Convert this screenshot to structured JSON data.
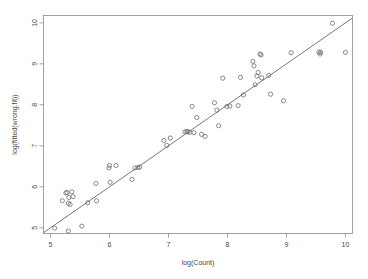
{
  "chart_data": {
    "type": "scatter",
    "title": "",
    "xlabel": "log(Count)",
    "ylabel": "log(fitted(wrong.fit))",
    "xlim": [
      4.88,
      10.12
    ],
    "ylim": [
      4.86,
      10.18
    ],
    "grid": false,
    "legend": null,
    "xticks": [
      5,
      6,
      7,
      8,
      9,
      10
    ],
    "yticks": [
      5,
      6,
      7,
      8,
      9,
      10
    ],
    "xtick_labels": [
      "5",
      "6",
      "7",
      "8",
      "9",
      "10"
    ],
    "ytick_labels": [
      "5",
      "6",
      "7",
      "8",
      "9",
      "10"
    ],
    "reference_line": {
      "type": "identity",
      "x": [
        4.88,
        10.12
      ],
      "y": [
        4.88,
        10.12
      ]
    },
    "point_marker": "open-circle",
    "points": [
      {
        "x": 5.07,
        "y": 4.99
      },
      {
        "x": 5.3,
        "y": 4.92
      },
      {
        "x": 5.53,
        "y": 5.04
      },
      {
        "x": 5.2,
        "y": 5.66
      },
      {
        "x": 5.26,
        "y": 5.85
      },
      {
        "x": 5.28,
        "y": 5.86
      },
      {
        "x": 5.31,
        "y": 5.74
      },
      {
        "x": 5.33,
        "y": 5.57
      },
      {
        "x": 5.36,
        "y": 5.88
      },
      {
        "x": 5.38,
        "y": 5.76
      },
      {
        "x": 5.3,
        "y": 5.6
      },
      {
        "x": 5.63,
        "y": 5.61
      },
      {
        "x": 5.78,
        "y": 5.66
      },
      {
        "x": 5.77,
        "y": 6.08
      },
      {
        "x": 6.01,
        "y": 6.11
      },
      {
        "x": 5.99,
        "y": 6.46
      },
      {
        "x": 6.0,
        "y": 6.52
      },
      {
        "x": 6.11,
        "y": 6.52
      },
      {
        "x": 6.38,
        "y": 6.18
      },
      {
        "x": 6.43,
        "y": 6.46
      },
      {
        "x": 6.48,
        "y": 6.47
      },
      {
        "x": 6.51,
        "y": 6.48
      },
      {
        "x": 6.92,
        "y": 7.13
      },
      {
        "x": 6.97,
        "y": 7.01
      },
      {
        "x": 7.03,
        "y": 7.19
      },
      {
        "x": 7.28,
        "y": 7.34
      },
      {
        "x": 7.31,
        "y": 7.35
      },
      {
        "x": 7.33,
        "y": 7.34
      },
      {
        "x": 7.36,
        "y": 7.33
      },
      {
        "x": 7.4,
        "y": 7.96
      },
      {
        "x": 7.43,
        "y": 7.32
      },
      {
        "x": 7.48,
        "y": 7.69
      },
      {
        "x": 7.56,
        "y": 7.28
      },
      {
        "x": 7.62,
        "y": 7.23
      },
      {
        "x": 7.78,
        "y": 8.05
      },
      {
        "x": 7.82,
        "y": 7.87
      },
      {
        "x": 7.85,
        "y": 7.49
      },
      {
        "x": 7.92,
        "y": 8.65
      },
      {
        "x": 7.99,
        "y": 7.96
      },
      {
        "x": 8.04,
        "y": 7.97
      },
      {
        "x": 8.18,
        "y": 7.98
      },
      {
        "x": 8.22,
        "y": 8.67
      },
      {
        "x": 8.27,
        "y": 8.24
      },
      {
        "x": 8.43,
        "y": 9.06
      },
      {
        "x": 8.45,
        "y": 8.95
      },
      {
        "x": 8.47,
        "y": 8.49
      },
      {
        "x": 8.5,
        "y": 8.7
      },
      {
        "x": 8.52,
        "y": 8.79
      },
      {
        "x": 8.55,
        "y": 9.24
      },
      {
        "x": 8.57,
        "y": 9.22
      },
      {
        "x": 8.58,
        "y": 8.66
      },
      {
        "x": 8.7,
        "y": 8.72
      },
      {
        "x": 8.73,
        "y": 8.26
      },
      {
        "x": 8.95,
        "y": 8.1
      },
      {
        "x": 9.08,
        "y": 9.27
      },
      {
        "x": 9.55,
        "y": 9.29
      },
      {
        "x": 9.57,
        "y": 9.24
      },
      {
        "x": 9.58,
        "y": 9.28
      },
      {
        "x": 9.78,
        "y": 9.99
      },
      {
        "x": 10.0,
        "y": 9.28
      }
    ]
  }
}
